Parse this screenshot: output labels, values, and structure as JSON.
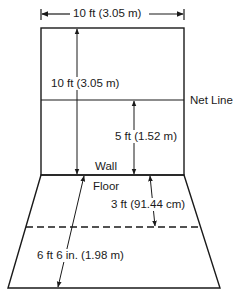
{
  "diagram": {
    "type": "court-wall-and-floor-dimensions",
    "colors": {
      "line": "#1a1a1a",
      "background": "#ffffff"
    },
    "labels": {
      "wall_width": "10 ft  (3.05  m)",
      "wall_height": "10 ft  (3.05  m)",
      "net_line": "Net Line",
      "net_height": "5 ft  (1.52  m)",
      "wall": "Wall",
      "floor": "Floor",
      "floor_line_distance": "3 ft  (91.44  cm)",
      "floor_depth": "6 ft  6 in. (1.98  m)"
    }
  }
}
